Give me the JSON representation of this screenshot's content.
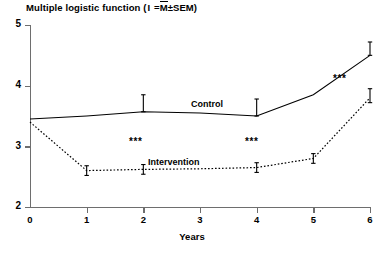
{
  "chart_data": {
    "type": "line",
    "title_parts": {
      "prefix": "Multiple logistic function (",
      "ibar": "I",
      "eq": " =",
      "mbar": "M",
      "suffix": "±SEM)"
    },
    "xlabel": "Years",
    "ylabel": "",
    "x": [
      0,
      1,
      2,
      3,
      4,
      5,
      6
    ],
    "xticklabels": [
      "0",
      "1",
      "2",
      "3",
      "4",
      "5",
      "6"
    ],
    "yticklabels": [
      "2",
      "3",
      "4",
      "5"
    ],
    "yticks": [
      2,
      3,
      4,
      5
    ],
    "xlim": [
      0,
      6
    ],
    "ylim": [
      2,
      5
    ],
    "grid": false,
    "legend": "inline-labels",
    "series": [
      {
        "name": "Control",
        "style": "solid",
        "values": [
          3.45,
          3.5,
          3.57,
          3.55,
          3.5,
          3.85,
          4.5
        ],
        "errorbars": [
          {
            "x": 2,
            "low": 3.57,
            "high": 3.85
          },
          {
            "x": 4,
            "low": 3.5,
            "high": 3.78
          },
          {
            "x": 6,
            "low": 4.5,
            "high": 4.72
          }
        ]
      },
      {
        "name": "Intervention",
        "style": "dotted",
        "values": [
          3.4,
          2.6,
          2.62,
          2.63,
          2.65,
          2.8,
          3.8
        ],
        "errorbars": [
          {
            "x": 1,
            "low": 2.52,
            "high": 2.68
          },
          {
            "x": 2,
            "low": 2.54,
            "high": 2.7
          },
          {
            "x": 4,
            "low": 2.57,
            "high": 2.73
          },
          {
            "x": 5,
            "low": 2.72,
            "high": 2.88
          },
          {
            "x": 6,
            "low": 3.72,
            "high": 3.95
          }
        ]
      }
    ],
    "annotations": [
      {
        "text": "***",
        "x": 2,
        "y": 3.05
      },
      {
        "text": "***",
        "x": 4,
        "y": 3.05
      },
      {
        "text": "***",
        "x": 6,
        "y": 4.15
      }
    ]
  },
  "colors": {
    "axis": "#6e6e6e",
    "ink": "#000000",
    "background": "#ffffff"
  }
}
